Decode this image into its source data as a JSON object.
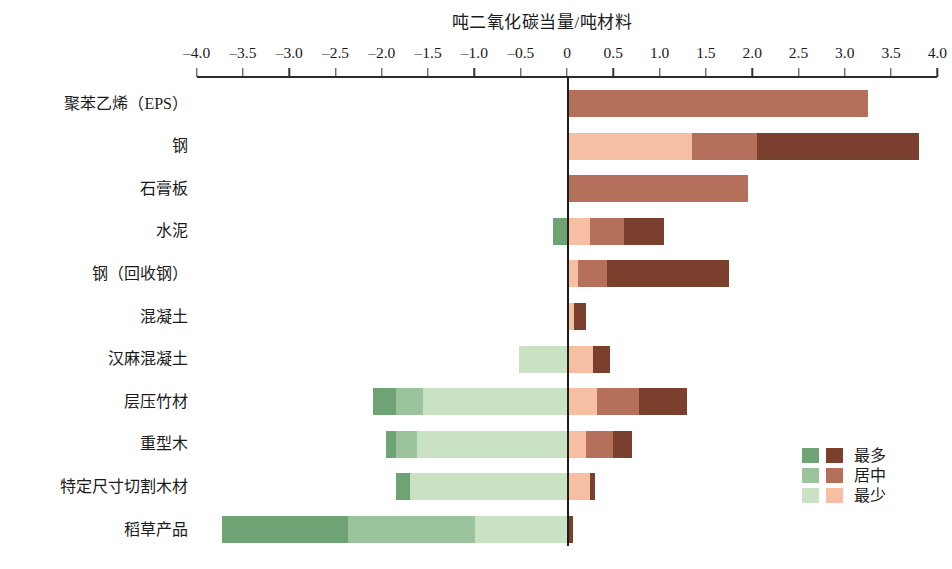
{
  "chart": {
    "title": "吨二氧化碳当量/吨材料",
    "axis_title": "吨二氧化碳当量/吨材料"
  },
  "legend": {
    "position": "bottom-right",
    "items": [
      {
        "label": "最多",
        "green": "#6fa374",
        "brown": "#7b3f2e"
      },
      {
        "label": "居中",
        "green": "#9cc49c",
        "brown": "#b5705c"
      },
      {
        "label": "最少",
        "green": "#c9e2c4",
        "brown": "#f6bfa4"
      }
    ]
  },
  "colors": {
    "green_most": "#6fa374",
    "green_mid": "#9cc49c",
    "green_least": "#c9e2c4",
    "brown_most": "#7b3f2e",
    "brown_mid": "#b5705c",
    "brown_least": "#f6bfa4",
    "axis": "#1d1d1d",
    "text": "#1a1a1a"
  },
  "chart_data": {
    "type": "bar",
    "subtype": "diverging-stacked-horizontal",
    "title": "吨二氧化碳当量/吨材料",
    "xlabel": "吨二氧化碳当量/吨材料",
    "ylabel": "",
    "xlim": [
      -4.0,
      4.0
    ],
    "xticks": [
      -4.0,
      -3.5,
      -3.0,
      -2.5,
      -2.0,
      -1.5,
      -1.0,
      -0.5,
      0,
      0.5,
      1.0,
      1.5,
      2.0,
      2.5,
      3.0,
      3.5,
      4.0
    ],
    "xticklabels": [
      "-4.0",
      "-3.5",
      "-3.0",
      "-2.5",
      "-2.0",
      "-1.5",
      "-1.0",
      "-0.5",
      "0",
      "0.5",
      "1.0",
      "1.5",
      "2.0",
      "2.5",
      "3.0",
      "3.5",
      "4.0"
    ],
    "grid": false,
    "legend": [
      "最多",
      "居中",
      "最少"
    ],
    "categories": [
      "聚苯乙烯（EPS）",
      "钢",
      "石膏板",
      "水泥",
      "钢（回收钢）",
      "混凝土",
      "汉麻混凝土",
      "层压竹材",
      "重型木",
      "特定尺寸切割木材",
      "稻草产品"
    ],
    "series": [
      {
        "name": "最少",
        "side": "positive",
        "color": "#f6bfa4",
        "values": [
          0.0,
          1.35,
          0.0,
          0.25,
          0.12,
          0.08,
          0.28,
          0.32,
          0.2,
          0.25,
          0.0
        ]
      },
      {
        "name": "居中",
        "side": "positive",
        "color": "#b5705c",
        "values": [
          3.25,
          0.7,
          1.95,
          0.37,
          0.31,
          0.0,
          0.0,
          0.46,
          0.3,
          0.0,
          0.0
        ]
      },
      {
        "name": "最多",
        "side": "positive",
        "color": "#7b3f2e",
        "values": [
          0.0,
          1.75,
          0.0,
          0.43,
          1.32,
          0.12,
          0.18,
          0.52,
          0.2,
          0.05,
          0.06
        ]
      },
      {
        "name": "最少",
        "side": "negative",
        "color": "#c9e2c4",
        "values": [
          0.0,
          0.0,
          0.0,
          0.0,
          0.0,
          0.0,
          0.52,
          1.55,
          1.62,
          1.7,
          1.15
        ]
      },
      {
        "name": "居中",
        "side": "negative",
        "color": "#9cc49c",
        "values": [
          0.0,
          0.0,
          0.0,
          0.0,
          0.0,
          0.0,
          0.0,
          0.3,
          0.23,
          0.0,
          1.25
        ]
      },
      {
        "name": "最多",
        "side": "negative",
        "color": "#6fa374",
        "values": [
          0.0,
          0.0,
          0.0,
          0.15,
          0.0,
          0.0,
          0.0,
          0.25,
          0.1,
          0.15,
          1.33
        ]
      }
    ],
    "bars": [
      {
        "category": "聚苯乙烯（EPS）",
        "negative": [],
        "positive": [
          {
            "level": "居中",
            "from": 0.0,
            "to": 3.25,
            "color": "#b5705c"
          }
        ]
      },
      {
        "category": "钢",
        "negative": [],
        "positive": [
          {
            "level": "最少",
            "from": 0.0,
            "to": 1.35,
            "color": "#f6bfa4"
          },
          {
            "level": "居中",
            "from": 1.35,
            "to": 2.05,
            "color": "#b5705c"
          },
          {
            "level": "最多",
            "from": 2.05,
            "to": 3.8,
            "color": "#7b3f2e"
          }
        ]
      },
      {
        "category": "石膏板",
        "negative": [],
        "positive": [
          {
            "level": "居中",
            "from": 0.0,
            "to": 1.95,
            "color": "#b5705c"
          }
        ]
      },
      {
        "category": "水泥",
        "negative": [
          {
            "level": "最多",
            "from": -0.15,
            "to": 0.0,
            "color": "#6fa374"
          }
        ],
        "positive": [
          {
            "level": "最少",
            "from": 0.0,
            "to": 0.25,
            "color": "#f6bfa4"
          },
          {
            "level": "居中",
            "from": 0.25,
            "to": 0.62,
            "color": "#b5705c"
          },
          {
            "level": "最多",
            "from": 0.62,
            "to": 1.05,
            "color": "#7b3f2e"
          }
        ]
      },
      {
        "category": "钢（回收钢）",
        "negative": [],
        "positive": [
          {
            "level": "最少",
            "from": 0.0,
            "to": 0.12,
            "color": "#f6bfa4"
          },
          {
            "level": "居中",
            "from": 0.12,
            "to": 0.43,
            "color": "#b5705c"
          },
          {
            "level": "最多",
            "from": 0.43,
            "to": 1.75,
            "color": "#7b3f2e"
          }
        ]
      },
      {
        "category": "混凝土",
        "negative": [],
        "positive": [
          {
            "level": "最少",
            "from": 0.0,
            "to": 0.08,
            "color": "#f6bfa4"
          },
          {
            "level": "最多",
            "from": 0.08,
            "to": 0.2,
            "color": "#7b3f2e"
          }
        ]
      },
      {
        "category": "汉麻混凝土",
        "negative": [
          {
            "level": "最少",
            "from": -0.52,
            "to": 0.0,
            "color": "#c9e2c4"
          }
        ],
        "positive": [
          {
            "level": "最少",
            "from": 0.0,
            "to": 0.28,
            "color": "#f6bfa4"
          },
          {
            "level": "最多",
            "from": 0.28,
            "to": 0.46,
            "color": "#7b3f2e"
          }
        ]
      },
      {
        "category": "层压竹材",
        "negative": [
          {
            "level": "最多",
            "from": -2.1,
            "to": -1.85,
            "color": "#6fa374"
          },
          {
            "level": "居中",
            "from": -1.85,
            "to": -1.55,
            "color": "#9cc49c"
          },
          {
            "level": "最少",
            "from": -1.55,
            "to": 0.0,
            "color": "#c9e2c4"
          }
        ],
        "positive": [
          {
            "level": "最少",
            "from": 0.0,
            "to": 0.32,
            "color": "#f6bfa4"
          },
          {
            "level": "居中",
            "from": 0.32,
            "to": 0.78,
            "color": "#b5705c"
          },
          {
            "level": "最多",
            "from": 0.78,
            "to": 1.3,
            "color": "#7b3f2e"
          }
        ]
      },
      {
        "category": "重型木",
        "negative": [
          {
            "level": "最多",
            "from": -1.95,
            "to": -1.85,
            "color": "#6fa374"
          },
          {
            "level": "居中",
            "from": -1.85,
            "to": -1.62,
            "color": "#9cc49c"
          },
          {
            "level": "最少",
            "from": -1.62,
            "to": 0.0,
            "color": "#c9e2c4"
          }
        ],
        "positive": [
          {
            "level": "最少",
            "from": 0.0,
            "to": 0.2,
            "color": "#f6bfa4"
          },
          {
            "level": "居中",
            "from": 0.2,
            "to": 0.5,
            "color": "#b5705c"
          },
          {
            "level": "最多",
            "from": 0.5,
            "to": 0.7,
            "color": "#7b3f2e"
          }
        ]
      },
      {
        "category": "特定尺寸切割木材",
        "negative": [
          {
            "level": "最多",
            "from": -1.85,
            "to": -1.7,
            "color": "#6fa374"
          },
          {
            "level": "最少",
            "from": -1.7,
            "to": 0.0,
            "color": "#c9e2c4"
          }
        ],
        "positive": [
          {
            "level": "最少",
            "from": 0.0,
            "to": 0.25,
            "color": "#f6bfa4"
          },
          {
            "level": "最多",
            "from": 0.25,
            "to": 0.3,
            "color": "#7b3f2e"
          }
        ]
      },
      {
        "category": "稻草产品",
        "negative": [
          {
            "level": "最多",
            "from": -3.73,
            "to": -2.36,
            "color": "#6fa374"
          },
          {
            "level": "居中",
            "from": -2.36,
            "to": -0.99,
            "color": "#9cc49c"
          },
          {
            "level": "最少",
            "from": -0.99,
            "to": 0.0,
            "color": "#c9e2c4"
          }
        ],
        "positive": [
          {
            "level": "最多",
            "from": 0.0,
            "to": 0.06,
            "color": "#7b3f2e"
          }
        ]
      }
    ]
  }
}
